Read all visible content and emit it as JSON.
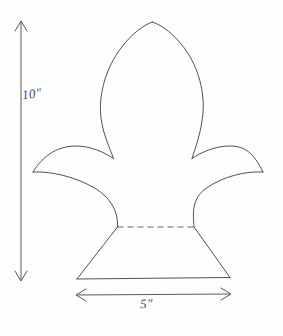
{
  "drawing": {
    "title": "Fleur-de-lis pattern with dimensions",
    "background_color": "#fdfdfd",
    "ink_color": "#3d3d3d",
    "line_width": 0.9
  },
  "dimensions": {
    "height": {
      "label": "10\"",
      "value": 10,
      "unit": "inch",
      "orientation": "vertical",
      "arrow_x": 21,
      "arrow_y_top": 21,
      "arrow_y_bottom": 281
    },
    "width": {
      "label": "5\"",
      "value": 5,
      "unit": "inch",
      "orientation": "horizontal",
      "arrow_y": 295,
      "arrow_x_left": 76,
      "arrow_x_right": 231
    }
  },
  "shape": {
    "name": "fleur-de-lis",
    "center_x": 153,
    "top_apex_y": 22,
    "base_y": 279,
    "base_left_x": 77,
    "base_right_x": 230,
    "left_lobe_tip_x": 33,
    "right_lobe_tip_x": 263,
    "lobe_tip_y": 172,
    "construction_line": {
      "style": "dashed",
      "y": 227,
      "x_start": 117,
      "x_end": 194
    }
  }
}
